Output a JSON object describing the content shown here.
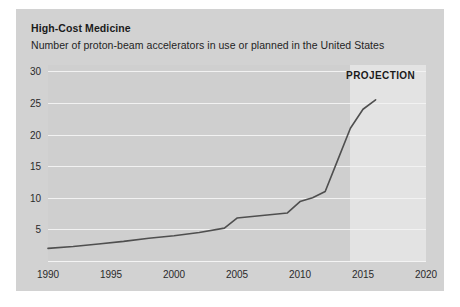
{
  "card": {
    "title": "High-Cost Medicine",
    "subtitle": "Number of proton-beam accelerators in use or planned in the United States",
    "background_color": "#d2d2d2"
  },
  "chart_data": {
    "type": "line",
    "title": "High-Cost Medicine",
    "subtitle": "Number of proton-beam accelerators in use or planned in the United States",
    "xlabel": "",
    "ylabel": "",
    "xlim": [
      1990,
      2020
    ],
    "ylim": [
      0,
      31
    ],
    "grid": true,
    "legend_position": "none",
    "line_color": "#4f4f4f",
    "plot_background_color": "#cfcfcf",
    "gridline_color": "#f2f2f2",
    "y_ticks": [
      5,
      10,
      15,
      20,
      25,
      30
    ],
    "x_ticks": [
      1990,
      1995,
      2000,
      2005,
      2010,
      2015,
      2020
    ],
    "annotations": [
      {
        "text": "PROJECTION",
        "x": 2016.4,
        "y": 29.4,
        "bold": true,
        "color": "#1b1b1b"
      }
    ],
    "shaded_regions": [
      {
        "label": "PROJECTION",
        "x_start": 2014.0,
        "x_end": 2020.0,
        "color": "#e3e3e3"
      }
    ],
    "series": [
      {
        "name": "Proton-beam accelerators",
        "x": [
          1990,
          1992,
          1994,
          1996,
          1998,
          2000,
          2002,
          2004,
          2005,
          2006,
          2007,
          2008,
          2009,
          2010,
          2011,
          2012,
          2013,
          2014,
          2015,
          2016
        ],
        "values": [
          2.0,
          2.3,
          2.7,
          3.1,
          3.6,
          4.0,
          4.5,
          5.2,
          6.8,
          7.0,
          7.2,
          7.4,
          7.6,
          9.4,
          10.0,
          11.0,
          16.0,
          21.0,
          24.0,
          25.5
        ]
      }
    ]
  }
}
